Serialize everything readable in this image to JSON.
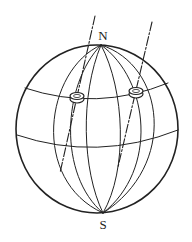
{
  "figure": {
    "labels": {
      "north": "N",
      "south": "S"
    },
    "colors": {
      "stroke": "#222222",
      "background": "#ffffff"
    }
  }
}
